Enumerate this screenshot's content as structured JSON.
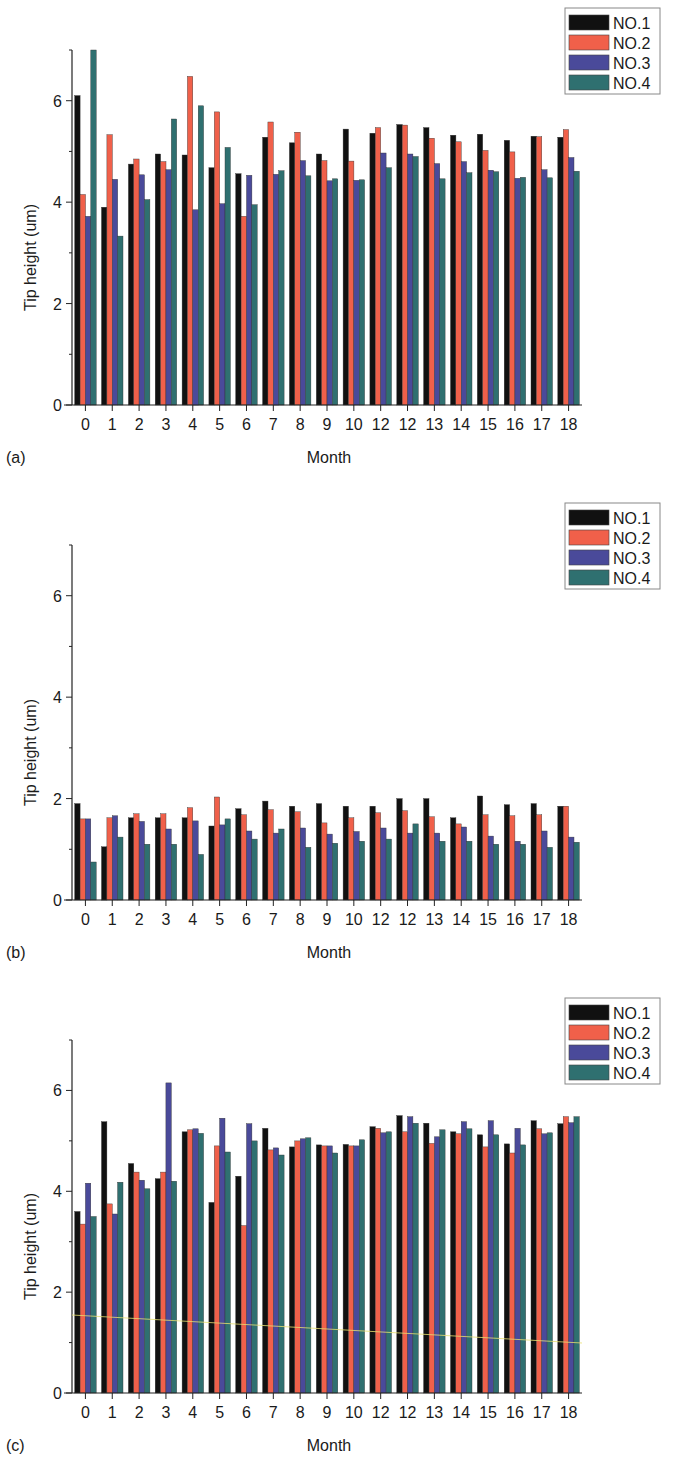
{
  "figure": {
    "legend": [
      "NO.1",
      "NO.2",
      "NO.3",
      "NO.4"
    ],
    "colors": [
      "#111111",
      "#f0604a",
      "#4a4a9a",
      "#2f7070"
    ]
  },
  "chart_data": [
    {
      "type": "bar",
      "panel_label": "(a)",
      "title": "",
      "xlabel": "Month",
      "ylabel": "Tip height (um)",
      "ylim": [
        0,
        7
      ],
      "yticks": [
        0,
        2,
        4,
        6
      ],
      "grid": false,
      "legend_position": "top-right",
      "categories": [
        "0",
        "1",
        "2",
        "3",
        "4",
        "5",
        "6",
        "7",
        "8",
        "9",
        "10",
        "12",
        "12",
        "13",
        "14",
        "15",
        "16",
        "17",
        "18"
      ],
      "series": [
        {
          "name": "NO.1",
          "values": [
            6.1,
            3.9,
            4.75,
            4.95,
            4.93,
            4.68,
            4.56,
            5.28,
            5.17,
            4.95,
            5.44,
            5.36,
            5.53,
            5.47,
            5.32,
            5.34,
            5.22,
            5.3,
            5.28
          ]
        },
        {
          "name": "NO.2",
          "values": [
            4.15,
            5.33,
            4.85,
            4.8,
            6.48,
            5.78,
            3.72,
            5.58,
            5.38,
            4.82,
            4.81,
            5.47,
            5.52,
            5.26,
            5.19,
            5.02,
            4.99,
            5.29,
            5.43
          ]
        },
        {
          "name": "NO.3",
          "values": [
            3.72,
            4.45,
            4.54,
            4.64,
            3.85,
            3.97,
            4.53,
            4.55,
            4.82,
            4.42,
            4.43,
            4.97,
            4.95,
            4.76,
            4.8,
            4.63,
            4.47,
            4.64,
            4.88
          ]
        },
        {
          "name": "NO.4",
          "values": [
            7.0,
            3.33,
            4.05,
            5.64,
            5.9,
            5.08,
            3.95,
            4.62,
            4.52,
            4.46,
            4.44,
            4.68,
            4.9,
            4.46,
            4.58,
            4.6,
            4.49,
            4.48,
            4.61
          ]
        }
      ]
    },
    {
      "type": "bar",
      "panel_label": "(b)",
      "title": "",
      "xlabel": "Month",
      "ylabel": "Tip height (um)",
      "ylim": [
        0,
        7
      ],
      "yticks": [
        0,
        2,
        4,
        6
      ],
      "grid": false,
      "legend_position": "top-right",
      "categories": [
        "0",
        "1",
        "2",
        "3",
        "4",
        "5",
        "6",
        "7",
        "8",
        "9",
        "10",
        "12",
        "12",
        "13",
        "14",
        "15",
        "16",
        "17",
        "18"
      ],
      "series": [
        {
          "name": "NO.1",
          "values": [
            1.9,
            1.05,
            1.62,
            1.62,
            1.62,
            1.46,
            1.8,
            1.95,
            1.85,
            1.9,
            1.85,
            1.85,
            2.0,
            2.0,
            1.62,
            2.05,
            1.88,
            1.9,
            1.85
          ]
        },
        {
          "name": "NO.2",
          "values": [
            1.6,
            1.62,
            1.7,
            1.7,
            1.82,
            2.03,
            1.68,
            1.78,
            1.74,
            1.52,
            1.62,
            1.72,
            1.76,
            1.64,
            1.5,
            1.68,
            1.66,
            1.68,
            1.85
          ]
        },
        {
          "name": "NO.3",
          "values": [
            1.6,
            1.66,
            1.55,
            1.4,
            1.56,
            1.48,
            1.36,
            1.32,
            1.42,
            1.3,
            1.35,
            1.42,
            1.32,
            1.32,
            1.44,
            1.26,
            1.16,
            1.36,
            1.24
          ]
        },
        {
          "name": "NO.4",
          "values": [
            0.75,
            1.24,
            1.1,
            1.1,
            0.9,
            1.6,
            1.2,
            1.4,
            1.04,
            1.12,
            1.16,
            1.2,
            1.5,
            1.16,
            1.16,
            1.1,
            1.1,
            1.04,
            1.14
          ]
        }
      ]
    },
    {
      "type": "bar",
      "panel_label": "(c)",
      "title": "",
      "xlabel": "Month",
      "ylabel": "Tip height (um)",
      "ylim": [
        0,
        7
      ],
      "yticks": [
        0,
        2,
        4,
        6
      ],
      "grid": false,
      "legend_position": "top-right",
      "categories": [
        "0",
        "1",
        "2",
        "3",
        "4",
        "5",
        "6",
        "7",
        "8",
        "9",
        "10",
        "12",
        "12",
        "13",
        "14",
        "15",
        "16",
        "17",
        "18"
      ],
      "series": [
        {
          "name": "NO.1",
          "values": [
            3.6,
            5.38,
            4.55,
            4.25,
            5.18,
            3.78,
            4.3,
            5.25,
            4.88,
            4.92,
            4.93,
            5.28,
            5.5,
            5.35,
            5.18,
            5.12,
            4.94,
            5.4,
            5.34
          ]
        },
        {
          "name": "NO.2",
          "values": [
            3.35,
            3.75,
            4.38,
            4.38,
            5.22,
            4.9,
            3.32,
            4.82,
            5.0,
            4.9,
            4.9,
            5.25,
            5.18,
            4.95,
            5.14,
            4.88,
            4.76,
            5.24,
            5.48
          ]
        },
        {
          "name": "NO.3",
          "values": [
            4.16,
            3.55,
            4.22,
            6.15,
            5.24,
            5.45,
            5.34,
            4.86,
            5.04,
            4.9,
            4.9,
            5.16,
            5.48,
            5.08,
            5.38,
            5.4,
            5.25,
            5.14,
            5.36
          ]
        },
        {
          "name": "NO.4",
          "values": [
            3.5,
            4.18,
            4.05,
            4.2,
            5.15,
            4.78,
            5.0,
            4.72,
            5.06,
            4.76,
            5.02,
            5.18,
            5.35,
            5.22,
            5.24,
            5.12,
            4.92,
            5.16,
            5.48
          ]
        }
      ]
    }
  ]
}
